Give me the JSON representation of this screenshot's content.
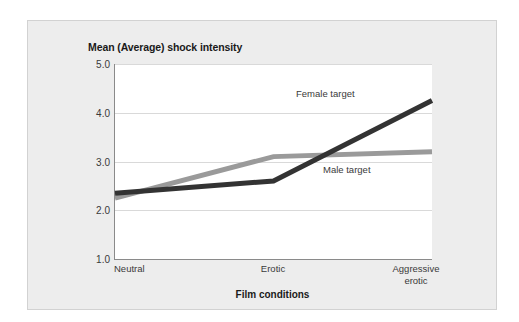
{
  "figure": {
    "background_color": "#ededed",
    "plot_background_color": "#ffffff",
    "axis_color": "#8a8a8a",
    "grid_color": "#d9d9d9"
  },
  "chart_data": {
    "type": "line",
    "title": "Mean (Average) shock intensity",
    "xlabel": "Film conditions",
    "ylabel": "",
    "categories": [
      "Neutral",
      "Erotic",
      "Aggressive\nerotic"
    ],
    "ylim": [
      1.0,
      5.0
    ],
    "yticks": [
      "5.0",
      "4.0",
      "3.0",
      "2.0",
      "1.0"
    ],
    "ytick_values": [
      5.0,
      4.0,
      3.0,
      2.0,
      1.0
    ],
    "grid": "horizontal",
    "legend": "inline-annotations",
    "series": [
      {
        "name": "Female target",
        "color": "#333333",
        "values": [
          2.35,
          2.6,
          4.25
        ],
        "label_text": "Female target"
      },
      {
        "name": "Male target",
        "color": "#9a9a9a",
        "values": [
          2.25,
          3.1,
          3.2
        ],
        "label_text": "Male target"
      }
    ]
  }
}
